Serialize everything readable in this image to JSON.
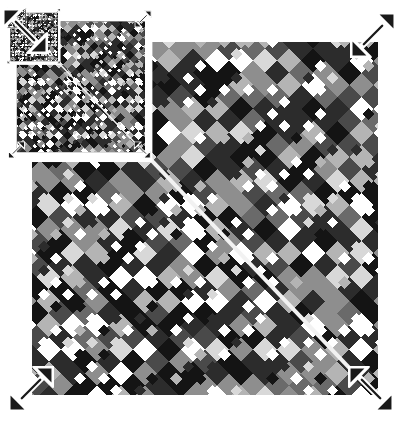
{
  "window": {
    "title": "Recursive Pattern Canvas",
    "background_color": "#ffffff"
  },
  "canvas": {
    "width": 399,
    "height": 422,
    "board": {
      "x": 32,
      "y": 42,
      "width": 346,
      "height": 353,
      "background_color": "#101010"
    }
  },
  "pattern": {
    "name": "diamond-argyle-lattice",
    "type": "diagonal-checker",
    "cell_size": 17,
    "rotation_deg": 45,
    "palette": [
      "#ffffff",
      "#d8d8d8",
      "#b4b4b4",
      "#8e8e8e",
      "#6a6a6a",
      "#4a4a4a",
      "#2c2c2c",
      "#141414",
      "#000000"
    ],
    "accent_color": "#f2f2f2",
    "dark_color": "#101010",
    "light_color": "#ffffff",
    "seed": 20250217,
    "columns": 21,
    "rows": 21
  },
  "diagonal_line": {
    "name": "highlight-diagonal",
    "color": "#f2f2f2",
    "thickness": 4,
    "start": {
      "x": 92,
      "y": 95
    },
    "end": {
      "x": 356,
      "y": 372
    },
    "angle_deg": 46
  },
  "handles": {
    "label": "resize-handle",
    "color": "#1a1a1a",
    "outline_color": "#ffffff",
    "items": [
      {
        "name": "resize-handle-top-left",
        "direction": "nw-se",
        "x": 2,
        "y": 8,
        "size": 46
      },
      {
        "name": "resize-handle-top-right",
        "direction": "ne-sw",
        "x": 350,
        "y": 12,
        "size": 46
      },
      {
        "name": "resize-handle-bottom-left",
        "direction": "ne-sw",
        "x": 8,
        "y": 366,
        "size": 46
      },
      {
        "name": "resize-handle-bottom-right",
        "direction": "nw-se",
        "x": 348,
        "y": 366,
        "size": 46
      }
    ]
  },
  "recursion": {
    "name": "droste-nesting",
    "depth": 4,
    "scale_factor": 0.37,
    "anchor": "top-left",
    "offset_x": -8,
    "offset_y": -6,
    "levels": [
      {
        "index": 0,
        "scale": 1.0,
        "x": 0,
        "y": 0,
        "label": "root"
      },
      {
        "index": 1,
        "scale": 0.37,
        "x": 5,
        "y": 6,
        "label": "nested-1"
      },
      {
        "index": 2,
        "scale": 0.137,
        "x": 3,
        "y": 3,
        "label": "nested-2"
      },
      {
        "index": 3,
        "scale": 0.051,
        "x": 2,
        "y": 2,
        "label": "nested-3"
      }
    ]
  }
}
